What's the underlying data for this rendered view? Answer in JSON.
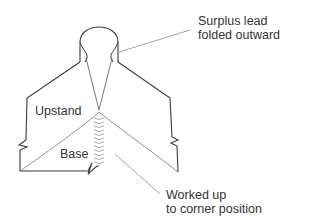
{
  "diagram": {
    "labels": {
      "surplus_line1": "Surplus lead",
      "surplus_line2": "folded outward",
      "upstand": "Upstand",
      "base": "Base",
      "worked_line1": "Worked up",
      "worked_line2": "to corner position"
    },
    "colors": {
      "outline": "#3a3a3a",
      "leader": "#8a8a8a",
      "text": "#333333"
    }
  }
}
